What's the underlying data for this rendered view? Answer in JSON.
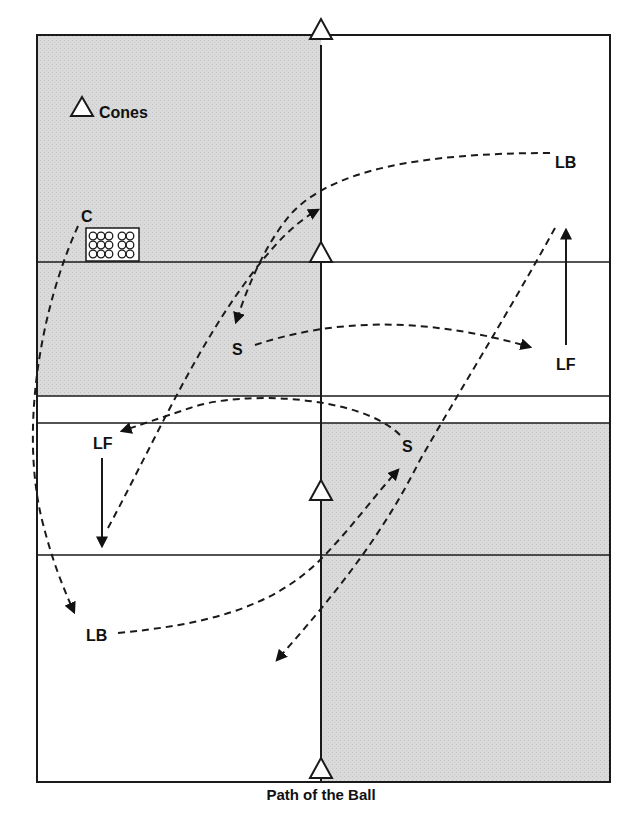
{
  "diagram": {
    "caption": "Path of the Ball",
    "legend": {
      "icon": "cone-icon",
      "label": "Cones"
    },
    "colors": {
      "shade": "#d6d6d6",
      "line": "#1a1a1a",
      "background": "#ffffff"
    },
    "field": {
      "left": 37,
      "top": 35,
      "right": 610,
      "bottom": 782,
      "center_x": 321,
      "horizontal_lines_y": [
        262,
        396,
        423,
        555
      ]
    },
    "ball_box": {
      "label": "C",
      "columns": 5,
      "rows": 3
    },
    "players": [
      {
        "id": "coach",
        "label": "C",
        "x": 88,
        "y": 220
      },
      {
        "id": "lb-top",
        "label": "LB",
        "x": 565,
        "y": 162
      },
      {
        "id": "lf-right",
        "label": "LF",
        "x": 565,
        "y": 366
      },
      {
        "id": "s-upper",
        "label": "S",
        "x": 238,
        "y": 352
      },
      {
        "id": "lf-left",
        "label": "LF",
        "x": 100,
        "y": 444
      },
      {
        "id": "s-lower",
        "label": "S",
        "x": 409,
        "y": 446
      },
      {
        "id": "lb-bottom",
        "label": "LB",
        "x": 97,
        "y": 640
      }
    ],
    "cones": [
      {
        "x": 321,
        "y": 35
      },
      {
        "x": 321,
        "y": 262
      },
      {
        "x": 321,
        "y": 500
      },
      {
        "x": 321,
        "y": 782
      }
    ]
  }
}
